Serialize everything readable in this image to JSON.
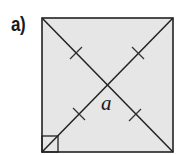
{
  "figure": {
    "label": "a)",
    "angle_label": "a",
    "shape": "square",
    "fill_color": "#e6e6e6",
    "stroke_color": "#222222",
    "square": {
      "x": 42,
      "y": 18,
      "width": 131,
      "height": 134
    },
    "diagonals": [
      {
        "x1": 42,
        "y1": 18,
        "x2": 173,
        "y2": 152
      },
      {
        "x1": 42,
        "y1": 152,
        "x2": 173,
        "y2": 18
      }
    ],
    "center": {
      "x": 108,
      "y": 85
    },
    "tick_marks": [
      {
        "x": 76,
        "y": 53
      },
      {
        "x": 138,
        "y": 53
      },
      {
        "x": 79,
        "y": 114
      },
      {
        "x": 135,
        "y": 115
      }
    ],
    "right_angle_marker": {
      "corner": "bottom-left",
      "size": 16
    }
  }
}
